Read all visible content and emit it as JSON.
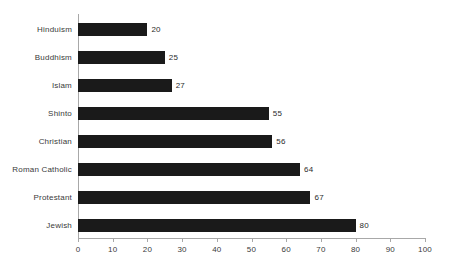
{
  "chart_data": {
    "type": "bar",
    "orientation": "horizontal",
    "title": "",
    "subtitle": "",
    "xlabel": "",
    "ylabel": "",
    "categories": [
      "Hinduism",
      "Buddhism",
      "Islam",
      "Shinto",
      "Christian",
      "Roman Catholic",
      "Protestant",
      "Jewish"
    ],
    "values": [
      20,
      25,
      27,
      55,
      56,
      64,
      67,
      80
    ],
    "data_labels": [
      "20",
      "25",
      "27",
      "55",
      "56",
      "64",
      "67",
      "80"
    ],
    "xlim": [
      0,
      100
    ],
    "xticks": [
      0,
      10,
      20,
      30,
      40,
      50,
      60,
      70,
      80,
      90,
      100
    ],
    "xtick_labels": [
      "0",
      "10",
      "20",
      "30",
      "40",
      "50",
      "60",
      "70",
      "80",
      "90",
      "100"
    ],
    "grid": false,
    "legend": false,
    "legend_position": "none",
    "bar_color": "#1a1a1a",
    "axis_color": "#a8a8a8",
    "text_color": "#3a3a3a",
    "background": "#ffffff"
  }
}
